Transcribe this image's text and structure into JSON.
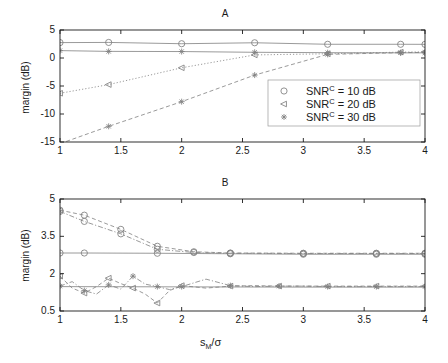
{
  "figure": {
    "width": 448,
    "height": 363,
    "background": "#ffffff",
    "line_color": "#808080",
    "axis_color": "#1a1a1a"
  },
  "panelA": {
    "title": "A",
    "ylabel": "margin (dB)",
    "yticks": [
      "5",
      "0",
      "-5",
      "-10",
      "-15"
    ],
    "ytick_values": [
      5,
      0,
      -5,
      -10,
      -15
    ],
    "xticks": [
      "1",
      "1.5",
      "2",
      "2.5",
      "3",
      "3.5",
      "4"
    ],
    "xtick_values": [
      1,
      1.5,
      2,
      2.5,
      3,
      3.5,
      4
    ]
  },
  "panelB": {
    "title": "B",
    "ylabel": "margin (dB)",
    "yticks": [
      "5",
      "3.5",
      "2",
      "0.5"
    ],
    "ytick_values": [
      5,
      3.5,
      2,
      0.5
    ],
    "xticks": [
      "1",
      "1.5",
      "2",
      "2.5",
      "3",
      "3.5",
      "4"
    ],
    "xtick_values": [
      1,
      1.5,
      2,
      2.5,
      3,
      3.5,
      4
    ]
  },
  "xlabel": {
    "base": "s",
    "sub": "M",
    "rest": "/σ"
  },
  "legend": {
    "position": "center-right-panelA",
    "entries": [
      {
        "marker": "circle",
        "prefix": "SNR",
        "sup": "C",
        "suffix": " = 10 dB"
      },
      {
        "marker": "left-triangle",
        "prefix": "SNR",
        "sup": "C",
        "suffix": " = 20 dB"
      },
      {
        "marker": "asterisk",
        "prefix": "SNR",
        "sup": "C",
        "suffix": " = 30 dB"
      }
    ]
  },
  "chart_data": [
    {
      "type": "line",
      "panel": "A",
      "title": "A",
      "xlabel": "s_M/sigma",
      "ylabel": "margin (dB)",
      "xlim": [
        1,
        4
      ],
      "ylim": [
        -15,
        5
      ],
      "grid": false,
      "legend_position": "center right",
      "series": [
        {
          "name": "SNR^C = 10 dB (flat upper)",
          "marker": "circle",
          "linestyle": "solid",
          "x": [
            1.0,
            1.4,
            2.0,
            2.6,
            3.2,
            3.8,
            4.0
          ],
          "y": [
            2.75,
            2.78,
            2.55,
            2.72,
            2.45,
            2.45,
            2.44
          ]
        },
        {
          "name": "SNR^C = 10 dB (flat lower)",
          "marker": "asterisk",
          "linestyle": "solid",
          "x": [
            1.0,
            1.4,
            2.0,
            2.6,
            3.2,
            3.8,
            4.0
          ],
          "y": [
            1.32,
            1.18,
            1.15,
            1.02,
            0.95,
            0.92,
            0.92
          ]
        },
        {
          "name": "SNR^C = 20 dB (rising)",
          "marker": "left-triangle",
          "linestyle": "dotted",
          "x": [
            1.0,
            1.4,
            2.0,
            2.6,
            3.2,
            3.8,
            4.0
          ],
          "y": [
            -6.3,
            -4.75,
            -1.75,
            0.55,
            0.75,
            1.05,
            1.1
          ]
        },
        {
          "name": "SNR^C = 30 dB (rising steep)",
          "marker": "asterisk",
          "linestyle": "dashed",
          "x": [
            1.0,
            1.4,
            2.0,
            2.6,
            3.2,
            3.8,
            4.0
          ],
          "y": [
            -15.3,
            -12.2,
            -7.8,
            -3.05,
            0.65,
            0.95,
            1.0
          ]
        }
      ]
    },
    {
      "type": "line",
      "panel": "B",
      "title": "B",
      "xlabel": "s_M/sigma",
      "ylabel": "margin (dB)",
      "xlim": [
        1,
        4
      ],
      "ylim": [
        0.5,
        5
      ],
      "grid": false,
      "series": [
        {
          "name": "SNR^C = 10 dB (decaying upper)",
          "marker": "circle",
          "linestyle": "dashed",
          "x": [
            1.0,
            1.2,
            1.5,
            1.8,
            2.1,
            2.4,
            3.0,
            3.6,
            4.0
          ],
          "y": [
            4.55,
            4.35,
            3.78,
            3.1,
            2.88,
            2.83,
            2.82,
            2.82,
            2.82
          ]
        },
        {
          "name": "SNR^C = 10 dB (decaying lower)",
          "marker": "circle",
          "linestyle": "dashdot",
          "x": [
            1.0,
            1.2,
            1.5,
            1.8,
            2.1,
            2.4,
            3.0,
            3.6,
            4.0
          ],
          "y": [
            4.5,
            4.1,
            3.6,
            2.98,
            2.85,
            2.82,
            2.81,
            2.81,
            2.81
          ]
        },
        {
          "name": "SNR^C = 10 dB (flat)",
          "marker": "circle",
          "linestyle": "solid",
          "x": [
            1.0,
            1.2,
            1.8,
            2.4,
            3.0,
            3.6,
            4.0
          ],
          "y": [
            2.83,
            2.83,
            2.82,
            2.8,
            2.78,
            2.78,
            2.78
          ]
        },
        {
          "name": "SNR^C = 20 dB (oscillating)",
          "marker": "left-triangle",
          "linestyle": "dashed",
          "x": [
            1.0,
            1.1,
            1.2,
            1.3,
            1.4,
            1.5,
            1.6,
            1.7,
            1.8,
            1.9,
            2.0,
            2.2,
            2.4,
            2.6,
            2.8,
            3.0,
            3.2,
            3.4,
            3.6,
            3.8,
            4.0
          ],
          "y": [
            1.9,
            1.42,
            1.22,
            1.48,
            1.82,
            1.6,
            1.42,
            1.18,
            0.82,
            1.32,
            1.52,
            1.42,
            1.5,
            1.52,
            1.5,
            1.5,
            1.5,
            1.5,
            1.5,
            1.5,
            1.5
          ]
        },
        {
          "name": "SNR^C = 30 dB (oscillating)",
          "marker": "asterisk",
          "linestyle": "dashdot",
          "x": [
            1.0,
            1.1,
            1.2,
            1.3,
            1.4,
            1.5,
            1.6,
            1.7,
            1.8,
            1.9,
            2.0,
            2.2,
            2.4,
            2.6,
            2.8,
            3.0,
            3.2,
            3.4,
            3.6,
            3.8,
            4.0
          ],
          "y": [
            1.5,
            1.68,
            1.32,
            1.18,
            1.55,
            1.38,
            1.9,
            1.58,
            1.48,
            1.36,
            1.48,
            1.78,
            1.52,
            1.48,
            1.5,
            1.5,
            1.48,
            1.48,
            1.48,
            1.48,
            1.48
          ]
        },
        {
          "name": "SNR^C = 20/30 dB (flat baseline)",
          "marker": "none",
          "linestyle": "solid",
          "x": [
            1.0,
            2.0,
            3.0,
            4.0
          ],
          "y": [
            1.48,
            1.47,
            1.46,
            1.46
          ]
        }
      ]
    }
  ]
}
